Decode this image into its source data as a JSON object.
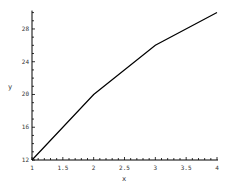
{
  "chart_data": {
    "type": "line",
    "title": "",
    "xlabel": "x",
    "ylabel": "y",
    "x": [
      1,
      2,
      3,
      4
    ],
    "series": [
      {
        "name": "y",
        "values": [
          12,
          20,
          26,
          30
        ]
      }
    ],
    "xlim": [
      1,
      4
    ],
    "ylim": [
      12,
      30
    ],
    "x_ticks": [
      "1",
      "1.5",
      "2",
      "2.5",
      "3",
      "3.5",
      "4"
    ],
    "y_ticks": [
      "12",
      "16",
      "20",
      "24",
      "28"
    ],
    "grid": false,
    "legend": "none",
    "line_color": "#000000"
  }
}
